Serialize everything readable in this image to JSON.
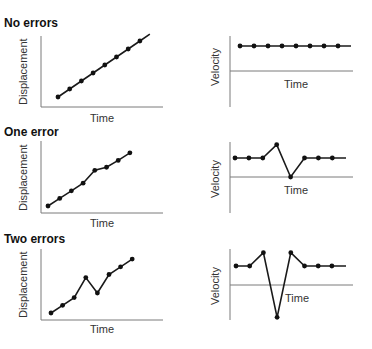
{
  "panels": [
    {
      "title": "No errors",
      "displacement": {
        "type": "line",
        "xlabel": "Time",
        "ylabel": "Displacement",
        "values": [
          1,
          2,
          3,
          4,
          5,
          6,
          7,
          8
        ],
        "line_extends_after_last": true
      },
      "velocity": {
        "type": "line",
        "xlabel": "Time",
        "ylabel": "Velocity",
        "values": [
          1,
          1,
          1,
          1,
          1,
          1,
          1,
          1
        ],
        "line_extends_after_last": true
      }
    },
    {
      "title": "One error",
      "displacement": {
        "type": "line",
        "xlabel": "Time",
        "ylabel": "Displacement",
        "values": [
          1,
          2,
          3,
          4,
          5.7,
          6.1,
          7,
          8
        ],
        "line_extends_after_last": false
      },
      "velocity": {
        "type": "line",
        "xlabel": "Time",
        "ylabel": "Velocity",
        "values": [
          1,
          1,
          1,
          1.7,
          0,
          1,
          1,
          1
        ],
        "line_extends_after_last": true
      }
    },
    {
      "title": "Two errors",
      "displacement": {
        "type": "line",
        "xlabel": "Time",
        "ylabel": "Displacement",
        "values": [
          1,
          2,
          3,
          5.6,
          3.6,
          6,
          7,
          8
        ],
        "line_extends_after_last": false
      },
      "velocity": {
        "type": "line",
        "xlabel": "Time",
        "ylabel": "Velocity",
        "values": [
          1,
          1,
          1.7,
          -1.7,
          1.7,
          1,
          1,
          1
        ],
        "line_extends_after_last": true
      }
    }
  ],
  "chart_data": [
    {
      "type": "line",
      "title": "No errors",
      "xlabel": "Time",
      "ylabel": "Displacement",
      "x": [
        1,
        2,
        3,
        4,
        5,
        6,
        7,
        8
      ],
      "values": [
        1,
        2,
        3,
        4,
        5,
        6,
        7,
        8
      ]
    },
    {
      "type": "line",
      "title": "No errors",
      "xlabel": "Time",
      "ylabel": "Velocity",
      "x": [
        1,
        2,
        3,
        4,
        5,
        6,
        7,
        8
      ],
      "values": [
        1,
        1,
        1,
        1,
        1,
        1,
        1,
        1
      ]
    },
    {
      "type": "line",
      "title": "One error",
      "xlabel": "Time",
      "ylabel": "Displacement",
      "x": [
        1,
        2,
        3,
        4,
        5,
        6,
        7,
        8
      ],
      "values": [
        1,
        2,
        3,
        4,
        5.7,
        6.1,
        7,
        8
      ]
    },
    {
      "type": "line",
      "title": "One error",
      "xlabel": "Time",
      "ylabel": "Velocity",
      "x": [
        1,
        2,
        3,
        4,
        5,
        6,
        7,
        8
      ],
      "values": [
        1,
        1,
        1,
        1.7,
        0,
        1,
        1,
        1
      ]
    },
    {
      "type": "line",
      "title": "Two errors",
      "xlabel": "Time",
      "ylabel": "Displacement",
      "x": [
        1,
        2,
        3,
        4,
        5,
        6,
        7,
        8
      ],
      "values": [
        1,
        2,
        3,
        5.6,
        3.6,
        6,
        7,
        8
      ]
    },
    {
      "type": "line",
      "title": "Two errors",
      "xlabel": "Time",
      "ylabel": "Velocity",
      "x": [
        1,
        2,
        3,
        4,
        5,
        6,
        7,
        8
      ],
      "values": [
        1,
        1,
        1.7,
        -1.7,
        1.7,
        1,
        1,
        1
      ]
    }
  ]
}
